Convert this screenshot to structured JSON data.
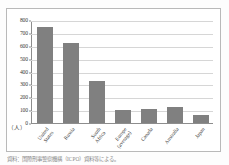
{
  "figure": {
    "unit_label": "（人）",
    "caption": "資料：国際刑事警察機構（ICPO）資料等による。"
  },
  "chart_data": {
    "type": "bar",
    "title": "",
    "subtitle": "",
    "xlabel": "",
    "ylabel": "（人）",
    "ylim": [
      0,
      800
    ],
    "ytick_values": [
      0,
      100,
      200,
      300,
      400,
      500,
      600,
      700,
      800
    ],
    "ytick_labels": [
      "0",
      "100",
      "200",
      "300",
      "400",
      "500",
      "600",
      "700",
      "800"
    ],
    "grid": true,
    "legend": "none",
    "bar_color": "#808080",
    "categories": [
      "United States",
      "Russia",
      "South Africa",
      "Europe (average)",
      "Canada",
      "Australia",
      "Japan"
    ],
    "category_lines": [
      [
        "United",
        "States"
      ],
      [
        "Russia",
        ""
      ],
      [
        "South",
        "Africa"
      ],
      [
        "Europe",
        "(average)"
      ],
      [
        "Canada",
        ""
      ],
      [
        "Australia",
        ""
      ],
      [
        "Japan",
        ""
      ]
    ],
    "values": [
      752,
      624,
      330,
      100,
      112,
      124,
      60
    ]
  },
  "colors": {
    "bar": "#808080",
    "grid": "#d6d6d6",
    "axis": "#8d8d8d",
    "frame": "#b9b9b9",
    "text": "#3a3a3a"
  }
}
